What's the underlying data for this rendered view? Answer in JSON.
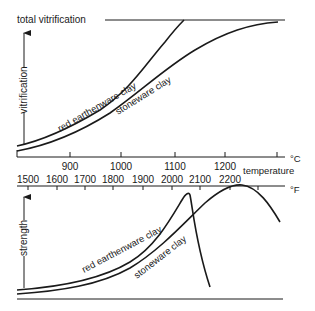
{
  "top_chart": {
    "total_label": "total vitrification",
    "y_axis_label": "vitrification",
    "curves": [
      {
        "name": "red earthenware clay"
      },
      {
        "name": "stoneware clay"
      }
    ]
  },
  "temperature_axes": {
    "title": "temperature",
    "celsius_unit": "°C",
    "fahrenheit_unit": "°F",
    "celsius_ticks": [
      "900",
      "1000",
      "1100",
      "1200"
    ],
    "fahrenheit_ticks": [
      "1500",
      "1600",
      "1700",
      "1800",
      "1900",
      "2000",
      "2100",
      "2200"
    ]
  },
  "bottom_chart": {
    "y_axis_label": "strength",
    "curves": [
      {
        "name": "red earthenware clay"
      },
      {
        "name": "stoneware clay"
      }
    ]
  }
}
